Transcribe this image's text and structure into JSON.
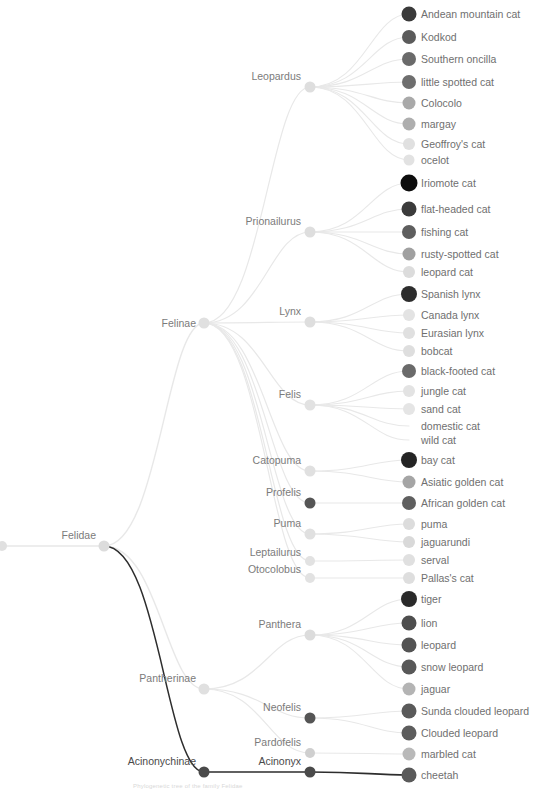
{
  "figure": {
    "type": "phylogenetic-tree",
    "background_color": "#ffffff",
    "caption_partial": "Phylogenetic tree of the family Felidae",
    "highlight_color": "#2d2d2d",
    "branch_color": "#e8e8e8",
    "label_color": "#6f6f6f"
  },
  "layout": {
    "width": 533,
    "height": 791,
    "leaf_dot_x": 409,
    "leaf_label_x": 421,
    "root_x": 0,
    "root_y": 546
  },
  "internal_nodes": [
    {
      "name": "root-stub",
      "label": "",
      "x": 2,
      "y": 546,
      "r": 5.0,
      "color": "#e0e0e0",
      "highlight": false,
      "show_label": false
    },
    {
      "name": "Felidae",
      "label": "Felidae",
      "x": 104,
      "y": 546,
      "r": 5.5,
      "color": "#dcdcdc",
      "highlight": false,
      "show_label": true,
      "label_dx": -8,
      "label_dy": -11
    },
    {
      "name": "Felinae",
      "label": "Felinae",
      "x": 204,
      "y": 323,
      "r": 5.5,
      "color": "#e0e0e0",
      "highlight": false,
      "show_label": true,
      "label_dx": -8,
      "label_dy": 0
    },
    {
      "name": "Pantherinae",
      "label": "Pantherinae",
      "x": 204,
      "y": 689,
      "r": 5.5,
      "color": "#e0e0e0",
      "highlight": false,
      "show_label": true,
      "label_dx": -8,
      "label_dy": -11
    },
    {
      "name": "Acinonychinae",
      "label": "Acinonychinae",
      "x": 204,
      "y": 772,
      "r": 5.5,
      "color": "#4a4a4a",
      "highlight": true,
      "show_label": true,
      "label_dx": -8,
      "label_dy": -11
    },
    {
      "name": "Leopardus",
      "label": "Leopardus",
      "x": 310,
      "y": 87,
      "r": 5.5,
      "color": "#dedede",
      "highlight": false,
      "show_label": true,
      "label_dx": -9,
      "label_dy": -11
    },
    {
      "name": "Prionailurus",
      "label": "Prionailurus",
      "x": 310,
      "y": 232,
      "r": 5.5,
      "color": "#dedede",
      "highlight": false,
      "show_label": true,
      "label_dx": -9,
      "label_dy": -11
    },
    {
      "name": "Lynx",
      "label": "Lynx",
      "x": 310,
      "y": 322,
      "r": 5.5,
      "color": "#dedede",
      "highlight": false,
      "show_label": true,
      "label_dx": -9,
      "label_dy": -11
    },
    {
      "name": "Felis",
      "label": "Felis",
      "x": 310,
      "y": 405,
      "r": 5.5,
      "color": "#e2e2e2",
      "highlight": false,
      "show_label": true,
      "label_dx": -9,
      "label_dy": -11
    },
    {
      "name": "Catopuma",
      "label": "Catopuma",
      "x": 310,
      "y": 471,
      "r": 5.5,
      "color": "#e0e0e0",
      "highlight": false,
      "show_label": true,
      "label_dx": -9,
      "label_dy": -11
    },
    {
      "name": "Profelis",
      "label": "Profelis",
      "x": 310,
      "y": 503,
      "r": 5.5,
      "color": "#555555",
      "highlight": false,
      "show_label": true,
      "label_dx": -9,
      "label_dy": -11
    },
    {
      "name": "Puma",
      "label": "Puma",
      "x": 310,
      "y": 534,
      "r": 5.5,
      "color": "#e0e0e0",
      "highlight": false,
      "show_label": true,
      "label_dx": -9,
      "label_dy": -11
    },
    {
      "name": "Leptailurus",
      "label": "Leptailurus",
      "x": 310,
      "y": 561,
      "r": 5.0,
      "color": "#e2e2e2",
      "highlight": false,
      "show_label": true,
      "label_dx": -9,
      "label_dy": -9
    },
    {
      "name": "Otocolobus",
      "label": "Otocolobus",
      "x": 310,
      "y": 578,
      "r": 5.0,
      "color": "#e2e2e2",
      "highlight": false,
      "show_label": true,
      "label_dx": -9,
      "label_dy": -9
    },
    {
      "name": "Panthera",
      "label": "Panthera",
      "x": 310,
      "y": 635,
      "r": 5.5,
      "color": "#dcdcdc",
      "highlight": false,
      "show_label": true,
      "label_dx": -9,
      "label_dy": -11
    },
    {
      "name": "Neofelis",
      "label": "Neofelis",
      "x": 310,
      "y": 718,
      "r": 5.5,
      "color": "#555555",
      "highlight": false,
      "show_label": true,
      "label_dx": -9,
      "label_dy": -11
    },
    {
      "name": "Pardofelis",
      "label": "Pardofelis",
      "x": 310,
      "y": 753,
      "r": 5.0,
      "color": "#cfcfcf",
      "highlight": false,
      "show_label": true,
      "label_dx": -9,
      "label_dy": -11
    },
    {
      "name": "Acinonyx",
      "label": "Acinonyx",
      "x": 310,
      "y": 772,
      "r": 5.5,
      "color": "#4a4a4a",
      "highlight": true,
      "show_label": true,
      "label_dx": -9,
      "label_dy": -11
    }
  ],
  "leaves": [
    {
      "label": "Andean mountain cat",
      "y": 14,
      "color": "#3a3a3a",
      "r": 7.5,
      "parent": "Leopardus",
      "dot": true,
      "highlight": false
    },
    {
      "label": "Kodkod",
      "y": 37,
      "color": "#5b5b5b",
      "r": 7.0,
      "parent": "Leopardus",
      "dot": true,
      "highlight": false
    },
    {
      "label": "Southern oncilla",
      "y": 59,
      "color": "#6a6a6a",
      "r": 7.0,
      "parent": "Leopardus",
      "dot": true,
      "highlight": false
    },
    {
      "label": "little spotted cat",
      "y": 82,
      "color": "#6e6e6e",
      "r": 7.0,
      "parent": "Leopardus",
      "dot": true,
      "highlight": false
    },
    {
      "label": "Colocolo",
      "y": 103,
      "color": "#a9a9a9",
      "r": 6.5,
      "parent": "Leopardus",
      "dot": true,
      "highlight": false
    },
    {
      "label": "margay",
      "y": 124,
      "color": "#aeaeae",
      "r": 6.5,
      "parent": "Leopardus",
      "dot": true,
      "highlight": false
    },
    {
      "label": "Geoffroy's cat",
      "y": 144,
      "color": "#e0e0e0",
      "r": 6.0,
      "parent": "Leopardus",
      "dot": true,
      "highlight": false
    },
    {
      "label": "ocelot",
      "y": 160,
      "color": "#e2e2e2",
      "r": 5.5,
      "parent": "Leopardus",
      "dot": true,
      "highlight": false
    },
    {
      "label": "Iriomote cat",
      "y": 183,
      "color": "#0d0d0d",
      "r": 8.5,
      "parent": "Prionailurus",
      "dot": true,
      "highlight": false
    },
    {
      "label": "flat-headed cat",
      "y": 209,
      "color": "#3b3b3b",
      "r": 7.5,
      "parent": "Prionailurus",
      "dot": true,
      "highlight": false
    },
    {
      "label": "fishing cat",
      "y": 232,
      "color": "#5e5e5e",
      "r": 7.0,
      "parent": "Prionailurus",
      "dot": true,
      "highlight": false
    },
    {
      "label": "rusty-spotted cat",
      "y": 254,
      "color": "#a0a0a0",
      "r": 6.5,
      "parent": "Prionailurus",
      "dot": true,
      "highlight": false
    },
    {
      "label": "leopard cat",
      "y": 272,
      "color": "#dcdcdc",
      "r": 6.0,
      "parent": "Prionailurus",
      "dot": true,
      "highlight": false
    },
    {
      "label": "Spanish lynx",
      "y": 294,
      "color": "#2d2d2d",
      "r": 8.0,
      "parent": "Lynx",
      "dot": true,
      "highlight": false
    },
    {
      "label": "Canada lynx",
      "y": 315,
      "color": "#e3e3e3",
      "r": 6.0,
      "parent": "Lynx",
      "dot": true,
      "highlight": false
    },
    {
      "label": "Eurasian lynx",
      "y": 333,
      "color": "#e0e0e0",
      "r": 6.0,
      "parent": "Lynx",
      "dot": true,
      "highlight": false
    },
    {
      "label": "bobcat",
      "y": 351,
      "color": "#dedede",
      "r": 6.0,
      "parent": "Lynx",
      "dot": true,
      "highlight": false
    },
    {
      "label": "black-footed cat",
      "y": 371,
      "color": "#6a6a6a",
      "r": 7.0,
      "parent": "Felis",
      "dot": true,
      "highlight": false
    },
    {
      "label": "jungle cat",
      "y": 391,
      "color": "#e3e3e3",
      "r": 6.0,
      "parent": "Felis",
      "dot": true,
      "highlight": false
    },
    {
      "label": "sand cat",
      "y": 409,
      "color": "#e5e5e5",
      "r": 6.0,
      "parent": "Felis",
      "dot": true,
      "highlight": false
    },
    {
      "label": "domestic cat",
      "y": 426,
      "color": "#ffffff",
      "r": 0.0,
      "parent": "Felis",
      "dot": false,
      "highlight": false
    },
    {
      "label": "wild cat",
      "y": 440,
      "color": "#ffffff",
      "r": 0.0,
      "parent": "Felis",
      "dot": false,
      "highlight": false
    },
    {
      "label": "bay cat",
      "y": 460,
      "color": "#242424",
      "r": 8.0,
      "parent": "Catopuma",
      "dot": true,
      "highlight": false
    },
    {
      "label": "Asiatic golden cat",
      "y": 482,
      "color": "#a5a5a5",
      "r": 6.5,
      "parent": "Catopuma",
      "dot": true,
      "highlight": false
    },
    {
      "label": "African golden cat",
      "y": 503,
      "color": "#5f5f5f",
      "r": 7.0,
      "parent": "Profelis",
      "dot": true,
      "highlight": false
    },
    {
      "label": "puma",
      "y": 524,
      "color": "#dcdcdc",
      "r": 6.0,
      "parent": "Puma",
      "dot": true,
      "highlight": false
    },
    {
      "label": "jaguarundi",
      "y": 542,
      "color": "#d9d9d9",
      "r": 6.0,
      "parent": "Puma",
      "dot": true,
      "highlight": false
    },
    {
      "label": "serval",
      "y": 560,
      "color": "#e0e0e0",
      "r": 6.0,
      "parent": "Leptailurus",
      "dot": true,
      "highlight": false
    },
    {
      "label": "Pallas's cat",
      "y": 578,
      "color": "#dedede",
      "r": 6.0,
      "parent": "Otocolobus",
      "dot": true,
      "highlight": false
    },
    {
      "label": "tiger",
      "y": 599,
      "color": "#2a2a2a",
      "r": 8.0,
      "parent": "Panthera",
      "dot": true,
      "highlight": false
    },
    {
      "label": "lion",
      "y": 623,
      "color": "#4e4e4e",
      "r": 7.5,
      "parent": "Panthera",
      "dot": true,
      "highlight": false
    },
    {
      "label": "leopard",
      "y": 645,
      "color": "#545454",
      "r": 7.5,
      "parent": "Panthera",
      "dot": true,
      "highlight": false
    },
    {
      "label": "snow leopard",
      "y": 667,
      "color": "#585858",
      "r": 7.5,
      "parent": "Panthera",
      "dot": true,
      "highlight": false
    },
    {
      "label": "jaguar",
      "y": 689,
      "color": "#b4b4b4",
      "r": 6.5,
      "parent": "Panthera",
      "dot": true,
      "highlight": false
    },
    {
      "label": "Sunda clouded leopard",
      "y": 711,
      "color": "#5a5a5a",
      "r": 7.5,
      "parent": "Neofelis",
      "dot": true,
      "highlight": false
    },
    {
      "label": "Clouded leopard",
      "y": 733,
      "color": "#5d5d5d",
      "r": 7.5,
      "parent": "Neofelis",
      "dot": true,
      "highlight": false
    },
    {
      "label": "marbled cat",
      "y": 754,
      "color": "#b9b9b9",
      "r": 6.5,
      "parent": "Pardofelis",
      "dot": true,
      "highlight": false
    },
    {
      "label": "cheetah",
      "y": 775,
      "color": "#5a5a5a",
      "r": 7.5,
      "parent": "Acinonyx",
      "dot": true,
      "highlight": true
    }
  ]
}
